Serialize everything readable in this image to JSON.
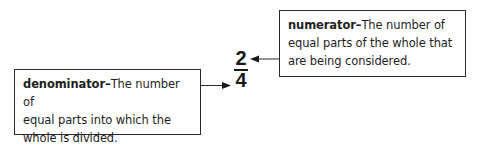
{
  "fraction": {
    "numerator": "2",
    "denominator": "4"
  },
  "numerator_callout": {
    "term": "numerator",
    "dash": "–",
    "definition_line1": "The number of",
    "definition_line2": "equal parts of the whole that",
    "definition_line3": "are being considered."
  },
  "denominator_callout": {
    "term": "denominator",
    "dash": "–",
    "definition_line1": "The number of",
    "definition_line2": "equal parts into which the",
    "definition_line3": "whole is divided."
  },
  "colors": {
    "ink": "#1e1e1e",
    "border": "#2a2a2a",
    "background": "#ffffff"
  }
}
